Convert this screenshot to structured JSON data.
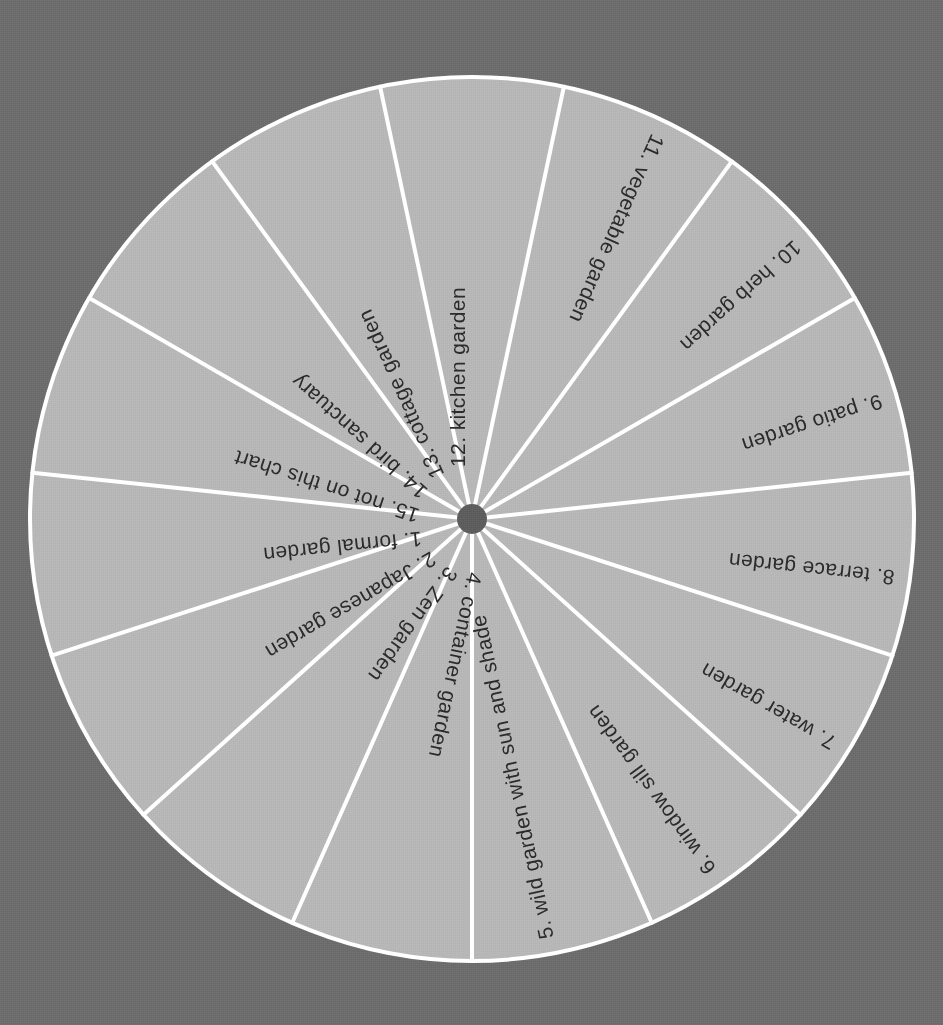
{
  "chart_data": {
    "type": "pie",
    "title": "",
    "subtitle": "",
    "xlabel": "",
    "ylabel": "",
    "legend_position": "none",
    "grid": false,
    "equal_slices": true,
    "slice_count": 15,
    "slice_angle_degrees": 24,
    "categories": [
      "1. formal garden",
      "2. Japanese garden",
      "3. Zen garden",
      "4. container garden",
      "5. wild garden with sun and shade",
      "6. window sill garden",
      "7. water garden",
      "8. terrace garden",
      "9. patio garden",
      "10. herb garden",
      "11. vegetable garden",
      "12. kitchen garden",
      "13. cottage garden",
      "14. bird sanctuary",
      "15. not on this chart"
    ],
    "values": [
      1,
      1,
      1,
      1,
      1,
      1,
      1,
      1,
      1,
      1,
      1,
      1,
      1,
      1,
      1
    ]
  },
  "wheel": {
    "center_x": 472,
    "center_y": 519,
    "radius": 442,
    "hub_radius": 15,
    "segments": [
      {
        "index": 1,
        "label": "1. formal garden",
        "mid_angle": 186
      },
      {
        "index": 2,
        "label": "2. Japanese garden",
        "mid_angle": 210
      },
      {
        "index": 3,
        "label": "3. Zen garden",
        "mid_angle": 234
      },
      {
        "index": 4,
        "label": "4. container garden",
        "mid_angle": 258
      },
      {
        "index": 5,
        "label": "5. wild garden with sun and shade",
        "mid_angle": 282
      },
      {
        "index": 6,
        "label": "6. window sill garden",
        "mid_angle": 306
      },
      {
        "index": 7,
        "label": "7. water garden",
        "mid_angle": 330
      },
      {
        "index": 8,
        "label": "8. terrace garden",
        "mid_angle": 354
      },
      {
        "index": 9,
        "label": "9. patio garden",
        "mid_angle": 18
      },
      {
        "index": 10,
        "label": "10. herb garden",
        "mid_angle": 42
      },
      {
        "index": 11,
        "label": "11. vegetable garden",
        "mid_angle": 66
      },
      {
        "index": 12,
        "label": "12. kitchen garden",
        "mid_angle": 90
      },
      {
        "index": 13,
        "label": "13. cottage garden",
        "mid_angle": 114
      },
      {
        "index": 14,
        "label": "14. bird sanctuary",
        "mid_angle": 138
      },
      {
        "index": 15,
        "label": "15. not on this chart",
        "mid_angle": 162
      }
    ]
  },
  "colors": {
    "background": "#6d6d6d",
    "slice_fill": "#b7b7b7",
    "divider": "#ffffff",
    "hub": "#5e5e5e",
    "label_text": "#2b2b2b"
  }
}
